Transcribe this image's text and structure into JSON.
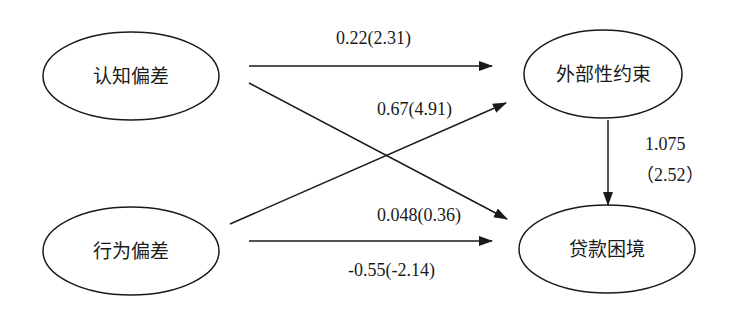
{
  "diagram": {
    "type": "path-diagram",
    "nodes": [
      {
        "id": "cognitive_bias",
        "label": "认知偏差",
        "cx": 131,
        "cy": 76,
        "rx": 88,
        "ry": 44
      },
      {
        "id": "behavioral_bias",
        "label": "行为偏差",
        "cx": 131,
        "cy": 251,
        "rx": 88,
        "ry": 44
      },
      {
        "id": "external_constraint",
        "label": "外部性约束",
        "cx": 603,
        "cy": 74,
        "rx": 79,
        "ry": 44
      },
      {
        "id": "loan_dilemma",
        "label": "贷款困境",
        "cx": 607,
        "cy": 249,
        "rx": 88,
        "ry": 44
      }
    ],
    "edges": [
      {
        "from": "cognitive_bias",
        "to": "external_constraint",
        "label": "0.22(2.31)"
      },
      {
        "from": "behavioral_bias",
        "to": "external_constraint",
        "label": "0.67(4.91)"
      },
      {
        "from": "cognitive_bias",
        "to": "loan_dilemma",
        "label": "0.048(0.36)"
      },
      {
        "from": "behavioral_bias",
        "to": "loan_dilemma",
        "label": "-0.55(-2.14)"
      },
      {
        "from": "external_constraint",
        "to": "loan_dilemma",
        "label": "1.075",
        "label2": "（2.52）"
      }
    ],
    "colors": {
      "stroke": "#1a1a1a",
      "background": "#ffffff"
    }
  }
}
